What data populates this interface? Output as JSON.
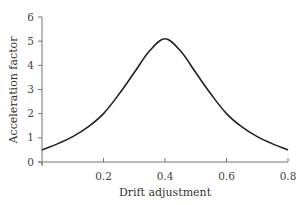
{
  "chart_data": {
    "type": "line",
    "title": "",
    "xlabel": "Drift adjustment",
    "ylabel": "Acceleration factor",
    "xlim": [
      0,
      0.8
    ],
    "ylim": [
      0,
      6
    ],
    "xticks": [
      0.2,
      0.4,
      0.6,
      0.8
    ],
    "xtick_labels": [
      "0.2",
      "0.4",
      "0.6",
      "0.8"
    ],
    "yticks": [
      0,
      1,
      2,
      3,
      4,
      5,
      6
    ],
    "ytick_labels": [
      "0",
      "1",
      "2",
      "3",
      "4",
      "5",
      "6"
    ],
    "grid": false,
    "legend": null,
    "series": [
      {
        "name": "Acceleration factor",
        "color": "#222222",
        "x": [
          0.0,
          0.05,
          0.1,
          0.15,
          0.2,
          0.25,
          0.3,
          0.35,
          0.4,
          0.45,
          0.5,
          0.55,
          0.6,
          0.65,
          0.7,
          0.75,
          0.8
        ],
        "y": [
          0.5,
          0.75,
          1.05,
          1.45,
          2.0,
          2.8,
          3.7,
          4.6,
          5.1,
          4.6,
          3.7,
          2.8,
          2.0,
          1.45,
          1.05,
          0.75,
          0.5
        ]
      }
    ]
  }
}
